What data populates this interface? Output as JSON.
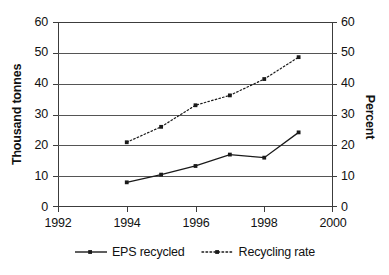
{
  "chart_data": {
    "type": "line",
    "title": "",
    "xlabel": "",
    "ylabel": "Thousand tonnes",
    "y2label": "Percent",
    "x": [
      1994,
      1995,
      1996,
      1997,
      1998,
      1999
    ],
    "xlim": [
      1992,
      2000
    ],
    "ylim": [
      0,
      60
    ],
    "y2lim": [
      0,
      60
    ],
    "xticks": [
      "1992",
      "1994",
      "1996",
      "1998",
      "2000"
    ],
    "xtick_values": [
      1992,
      1994,
      1996,
      1998,
      2000
    ],
    "yticks": [
      "0",
      "10",
      "20",
      "30",
      "40",
      "50",
      "60"
    ],
    "ytick_values": [
      0,
      10,
      20,
      30,
      40,
      50,
      60
    ],
    "y2ticks": [
      "0",
      "10",
      "20",
      "30",
      "40",
      "50",
      "60"
    ],
    "y2tick_values": [
      0,
      10,
      20,
      30,
      40,
      50,
      60
    ],
    "grid": "horizontal",
    "legend_position": "bottom",
    "series": [
      {
        "name": "EPS recycled",
        "axis": "left",
        "units": "Thousand tonnes",
        "style": "solid",
        "marker": "square",
        "color": "#1a1a1a",
        "values": [
          8,
          10.5,
          13.3,
          17,
          16,
          24.2
        ]
      },
      {
        "name": "Recycling rate",
        "axis": "right",
        "units": "Percent",
        "style": "dotted",
        "marker": "square",
        "color": "#1a1a1a",
        "values": [
          21,
          26,
          33,
          36.2,
          41.5,
          48.6
        ]
      }
    ]
  },
  "legend": {
    "entries": [
      {
        "label": "EPS recycled"
      },
      {
        "label": "Recycling rate"
      }
    ]
  }
}
